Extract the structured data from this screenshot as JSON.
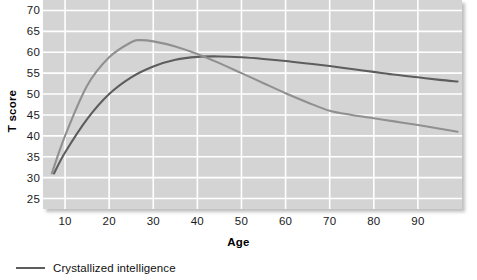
{
  "chart_data": {
    "type": "line",
    "title": "",
    "subtitle": "",
    "xlabel": "Age",
    "ylabel": "T score",
    "xlim": [
      5,
      100
    ],
    "ylim": [
      22.5,
      72.5
    ],
    "grid": true,
    "legend_position": "below-left",
    "xticks": [
      10,
      20,
      30,
      40,
      50,
      60,
      70,
      80,
      90
    ],
    "yticks": [
      25,
      30,
      35,
      40,
      45,
      50,
      55,
      60,
      65,
      70
    ],
    "series": [
      {
        "name": "Crystallized intelligence",
        "color": "#5d5d5d",
        "x": [
          7.5,
          10,
          15,
          20,
          25,
          30,
          35,
          40,
          45,
          50,
          55,
          60,
          65,
          70,
          75,
          80,
          85,
          90,
          95,
          99
        ],
        "values": [
          31.0,
          36.0,
          44.0,
          50.0,
          54.0,
          56.6,
          58.2,
          58.9,
          59.0,
          58.8,
          58.4,
          57.9,
          57.3,
          56.7,
          56.0,
          55.3,
          54.6,
          54.0,
          53.4,
          53.0
        ]
      },
      {
        "name": "Fluid intelligence",
        "color": "#909090",
        "x": [
          7,
          10,
          15,
          20,
          25,
          27,
          30,
          35,
          40,
          45,
          50,
          55,
          60,
          65,
          70,
          75,
          80,
          85,
          90,
          95,
          99
        ],
        "values": [
          31.0,
          40.0,
          52.0,
          58.8,
          62.4,
          62.9,
          62.6,
          61.4,
          59.6,
          57.4,
          55.0,
          52.6,
          50.2,
          48.0,
          46.0,
          45.0,
          44.2,
          43.4,
          42.6,
          41.7,
          41.0
        ]
      }
    ],
    "annotations": []
  },
  "axes": {
    "y_title": "T score",
    "x_title": "Age",
    "y_tick_labels": [
      "70",
      "65",
      "60",
      "55",
      "50",
      "45",
      "40",
      "35",
      "30",
      "25"
    ],
    "x_tick_labels": [
      "10",
      "20",
      "30",
      "40",
      "50",
      "60",
      "70",
      "80",
      "90"
    ]
  },
  "legend": {
    "entries": [
      {
        "label": "Crystallized intelligence",
        "color": "#5d5d5d"
      }
    ]
  },
  "colors": {
    "plot_background": "#d4d4d4",
    "gridline": "#ffffff",
    "page_background": "#ffffff",
    "crystallized": "#5d5d5d",
    "fluid": "#909090",
    "text": "#1a1a1a"
  }
}
